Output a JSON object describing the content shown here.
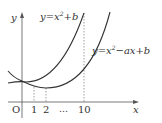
{
  "diagram": {
    "type": "function-graph",
    "axes": {
      "x_label": "x",
      "y_label": "y",
      "origin_label": "O"
    },
    "x_ticks": [
      "1",
      "2",
      "…",
      "10"
    ],
    "curves": [
      {
        "id": "curve-1",
        "label_base": "y=x",
        "label_exp": "2",
        "label_tail": "+b",
        "color": "#333333"
      },
      {
        "id": "curve-2",
        "label_base": "y=x",
        "label_exp": "2",
        "label_tail": "−ax+b",
        "color": "#333333"
      }
    ],
    "dashed_guides_at": [
      "1",
      "2",
      "10"
    ]
  }
}
